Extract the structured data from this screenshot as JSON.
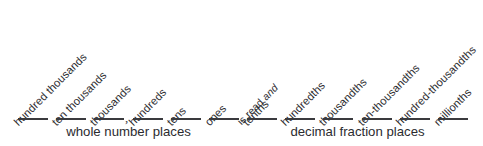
{
  "diagram": {
    "line_color": "#3a3a3e",
    "text_color": "#2e2e32",
    "background": "#ffffff",
    "places": [
      {
        "label": "hundred thousands",
        "x": 18,
        "width": 44,
        "label_x": 20,
        "label_y": 112,
        "group": "whole"
      },
      {
        "label": "ten thousands",
        "x": 72,
        "width": 44,
        "label_x": 74,
        "label_y": 112,
        "group": "whole"
      },
      {
        "label": "thousands",
        "x": 126,
        "width": 42,
        "label_x": 128,
        "label_y": 112,
        "group": "whole"
      },
      {
        "label": "hundreds",
        "x": 176,
        "width": 42,
        "label_x": 178,
        "label_y": 112,
        "group": "whole"
      },
      {
        "label": "tens",
        "x": 226,
        "width": 38,
        "label_x": 228,
        "label_y": 112,
        "group": "whole"
      },
      {
        "label": "ones",
        "x": 276,
        "width": 38,
        "label_x": 278,
        "label_y": 112,
        "group": "whole"
      },
      {
        "label": "tenths",
        "x": 328,
        "width": 38,
        "label_x": 330,
        "label_y": 112,
        "group": "decimal"
      },
      {
        "label": "hundredths",
        "x": 373,
        "width": 42,
        "label_x": 375,
        "label_y": 112,
        "group": "decimal"
      },
      {
        "label": "thousandths",
        "x": 425,
        "width": 42,
        "label_x": 427,
        "label_y": 112,
        "group": "decimal"
      },
      {
        "label": "ten-thousandths",
        "x": 477,
        "width": 44,
        "label_x": 479,
        "label_y": 112,
        "group": "decimal"
      },
      {
        "label": "hundred-thousandths",
        "x": 531,
        "width": 44,
        "label_x": 533,
        "label_y": 112,
        "group": "decimal"
      },
      {
        "label": "millionths",
        "x": 585,
        "width": 42,
        "label_x": 587,
        "label_y": 112,
        "group": "decimal"
      }
    ],
    "annotation": {
      "text_plain": "is read ",
      "text_italic": "and"
    },
    "separators": [
      {
        "symbol": ",",
        "name": "comma-separator"
      },
      {
        "symbol": ".",
        "name": "decimal-point"
      }
    ],
    "groups": [
      {
        "caption": "whole number places"
      },
      {
        "caption": "decimal fraction places"
      }
    ]
  }
}
